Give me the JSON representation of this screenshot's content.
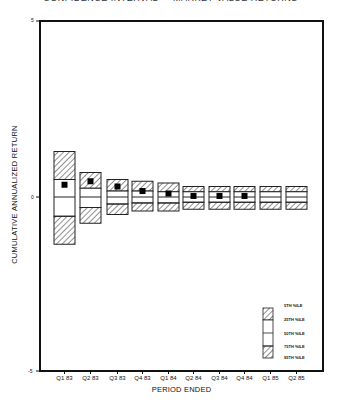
{
  "header": {
    "title": "CONFIDENCE INTERVAL — MARKET VALUE RETURNS"
  },
  "chart_data": {
    "type": "box",
    "title": "CONFIDENCE INTERVAL — MARKET VALUE RETURNS",
    "xlabel": "PERIOD ENDED",
    "ylabel": "CUMULATIVE ANNUALIZED RETURN",
    "ylim": [
      -5,
      5
    ],
    "yticks": [
      "5",
      "0",
      "-5"
    ],
    "grid": false,
    "legend_position": "lower right",
    "categories": [
      "Q1 83",
      "Q2 83",
      "Q3 83",
      "Q4 83",
      "Q1 84",
      "Q2 84",
      "Q3 84",
      "Q4 84",
      "Q1 85",
      "Q2 85"
    ],
    "series": [
      {
        "name": "5TH %ILE",
        "values": [
          1.3,
          0.7,
          0.5,
          0.45,
          0.4,
          0.3,
          0.3,
          0.3,
          0.3,
          0.3
        ]
      },
      {
        "name": "25TH %ILE",
        "values": [
          0.5,
          0.25,
          0.17,
          0.17,
          0.15,
          0.15,
          0.15,
          0.15,
          0.15,
          0.15
        ]
      },
      {
        "name": "50TH %ILE",
        "values": [
          0.0,
          0.0,
          0.0,
          0.0,
          0.0,
          0.0,
          0.0,
          0.0,
          0.0,
          0.0
        ]
      },
      {
        "name": "75TH %ILE",
        "values": [
          -0.55,
          -0.3,
          -0.2,
          -0.17,
          -0.17,
          -0.15,
          -0.15,
          -0.15,
          -0.15,
          -0.15
        ]
      },
      {
        "name": "95TH %ILE",
        "values": [
          -1.35,
          -0.75,
          -0.5,
          -0.4,
          -0.4,
          -0.35,
          -0.35,
          -0.35,
          -0.35,
          -0.35
        ]
      },
      {
        "name": "Actual",
        "values": [
          0.35,
          0.45,
          0.3,
          0.17,
          0.1,
          0.03,
          0.03,
          0.03,
          null,
          null
        ]
      }
    ]
  },
  "legend": {
    "items": [
      "5TH %ILE",
      "25TH %ILE",
      "50TH %ILE",
      "75TH %ILE",
      "95TH %ILE"
    ]
  }
}
